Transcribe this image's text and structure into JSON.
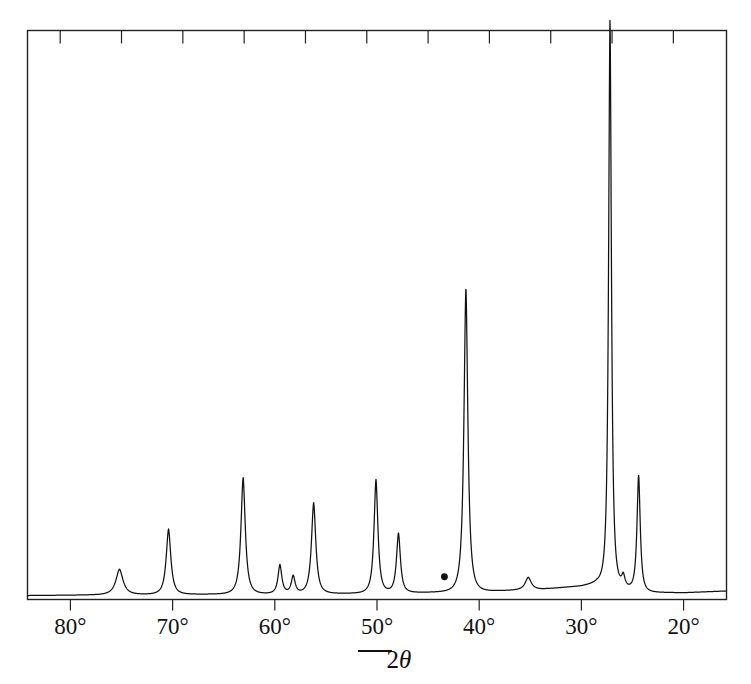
{
  "figure": {
    "kind": "xrd-diffractogram",
    "background_color": "#ffffff",
    "line_color": "#111111",
    "frame_color": "#222222"
  },
  "axis": {
    "title_prefix": "2",
    "title_symbol": "θ",
    "direction_hint": "decreasing-to-the-right",
    "tick_labels": [
      {
        "text": "80°",
        "value": 80
      },
      {
        "text": "70°",
        "value": 70
      },
      {
        "text": "60°",
        "value": 60
      },
      {
        "text": "50°",
        "value": 50
      },
      {
        "text": "40°",
        "value": 40
      },
      {
        "text": "30°",
        "value": 30
      },
      {
        "text": "20°",
        "value": 20
      }
    ]
  },
  "marker": {
    "name": "peak-marker-dot",
    "two_theta": 43.4,
    "intensity": 4,
    "color": "#111111"
  },
  "chart_data": {
    "type": "line",
    "title": "",
    "subtitle": "",
    "xlabel": "2θ",
    "ylabel": "",
    "xlim": [
      84.2,
      15.8
    ],
    "ylim": [
      0,
      100
    ],
    "x_axis_reversed": true,
    "grid": false,
    "legend": null,
    "annotations": [
      {
        "type": "dot",
        "x": 43.4,
        "y": 4,
        "label": ""
      },
      {
        "type": "axis-direction-bar",
        "x": 50.6,
        "label": ""
      }
    ],
    "major_ticks_x": [
      80,
      70,
      60,
      50,
      40,
      30,
      20
    ],
    "minor_tick_interval_top_deg": 6,
    "peaks": [
      {
        "two_theta": 75.2,
        "intensity": 4.5,
        "width": 1.3
      },
      {
        "two_theta": 70.4,
        "intensity": 11.5,
        "width": 0.85
      },
      {
        "two_theta": 63.1,
        "intensity": 20.5,
        "width": 0.8
      },
      {
        "two_theta": 59.5,
        "intensity": 5.1,
        "width": 0.7
      },
      {
        "two_theta": 58.2,
        "intensity": 3.1,
        "width": 0.7
      },
      {
        "two_theta": 56.2,
        "intensity": 16.0,
        "width": 0.8
      },
      {
        "two_theta": 50.1,
        "intensity": 20.0,
        "width": 0.72
      },
      {
        "two_theta": 47.9,
        "intensity": 10.5,
        "width": 0.72
      },
      {
        "two_theta": 41.3,
        "intensity": 53.5,
        "width": 0.72
      },
      {
        "two_theta": 35.2,
        "intensity": 2.2,
        "width": 1.1
      },
      {
        "two_theta": 27.2,
        "intensity": 100.0,
        "width": 0.52
      },
      {
        "two_theta": 25.9,
        "intensity": 2.0,
        "width": 0.6
      },
      {
        "two_theta": 24.4,
        "intensity": 20.5,
        "width": 0.6
      }
    ],
    "baseline": [
      {
        "two_theta": 84.2,
        "intensity": 0.7
      },
      {
        "two_theta": 78.0,
        "intensity": 0.8
      },
      {
        "two_theta": 70.0,
        "intensity": 0.9
      },
      {
        "two_theta": 60.0,
        "intensity": 1.0
      },
      {
        "two_theta": 50.0,
        "intensity": 1.1
      },
      {
        "two_theta": 44.0,
        "intensity": 1.3
      },
      {
        "two_theta": 40.0,
        "intensity": 1.4
      },
      {
        "two_theta": 34.0,
        "intensity": 1.8
      },
      {
        "two_theta": 30.0,
        "intensity": 2.4
      },
      {
        "two_theta": 28.5,
        "intensity": 2.9
      },
      {
        "two_theta": 24.0,
        "intensity": 1.3
      },
      {
        "two_theta": 20.0,
        "intensity": 1.2
      },
      {
        "two_theta": 15.8,
        "intensity": 1.5
      }
    ]
  }
}
